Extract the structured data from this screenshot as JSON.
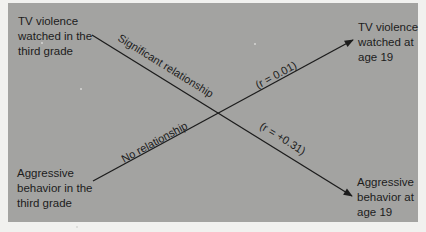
{
  "diagram": {
    "type": "cross-lagged correlation diagram",
    "nodes": {
      "top_left": "TV violence\nwatched in the\nthird grade",
      "top_right": "TV violence\nwatched at\nage 19",
      "bottom_left": "Aggressive\nbehavior in the\nthird grade",
      "bottom_right": "Aggressive\nbehavior at\nage 19"
    },
    "edges": [
      {
        "from": "TV violence watched in the third grade",
        "to": "Aggressive behavior at age 19",
        "label_upper": "Significant relationship",
        "label_lower": "(r = +0.31)"
      },
      {
        "from": "Aggressive behavior in the third grade",
        "to": "TV violence watched at age 19",
        "label_upper": "(r = 0.01)",
        "label_lower": "No relationship"
      }
    ],
    "colors": {
      "panel": "#a3a3a1",
      "page": "#f1f1ef",
      "ink": "#1c1c1c"
    }
  }
}
